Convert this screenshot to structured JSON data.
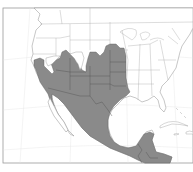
{
  "map": {
    "title": "",
    "subject": "species distribution range map",
    "region": "North America",
    "range_color": "#8a8a8a",
    "land_color": "#ffffff",
    "border_color": "#9a9a9a",
    "range_description": "Shaded range covering southwestern United States (California interior, Nevada, Utah, Arizona, New Mexico, Colorado, Texas, Oklahoma, Kansas, Nebraska, South Dakota, western Iowa/Missouri) south through Mexico into northern Central America",
    "features": [
      {
        "name": "United States",
        "shaded": "partial"
      },
      {
        "name": "Mexico",
        "shaded": "most"
      },
      {
        "name": "Central America",
        "shaded": "partial"
      },
      {
        "name": "Canada",
        "shaded": "none"
      },
      {
        "name": "Caribbean islands",
        "shaded": "none"
      }
    ]
  }
}
